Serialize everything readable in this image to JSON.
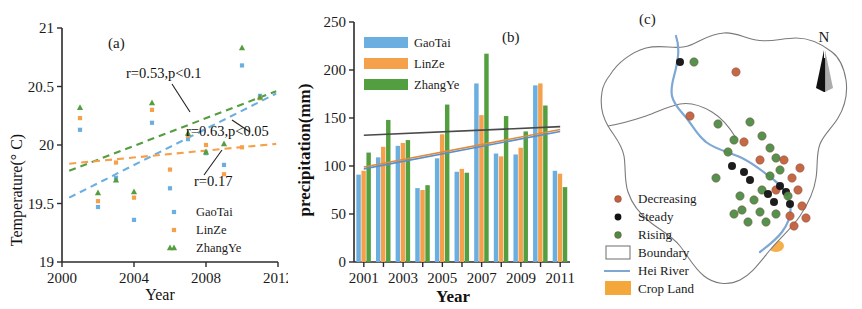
{
  "figure": {
    "panels": [
      "a",
      "b",
      "c"
    ]
  },
  "panel_a": {
    "tag": "(a)",
    "annotations": [
      {
        "text": "r=0.53,p<0.1"
      },
      {
        "text": "r=0.63,p<0.05"
      },
      {
        "text": "r=0.17"
      }
    ],
    "legend": [
      {
        "label": "GaoTai",
        "color": "#6BAEE0",
        "marker": "square"
      },
      {
        "label": "LinZe",
        "color": "#F5A04A",
        "marker": "square"
      },
      {
        "label": "ZhangYe",
        "color": "#539E3F",
        "marker": "triangle"
      }
    ]
  },
  "panel_b": {
    "tag": "(b)",
    "legend": [
      {
        "label": "GaoTai",
        "color": "#6BAEE0"
      },
      {
        "label": "LinZe",
        "color": "#F5A04A"
      },
      {
        "label": "ZhangYe",
        "color": "#539E3F"
      }
    ]
  },
  "panel_c": {
    "tag": "(c)",
    "north_label": "N",
    "legend": [
      {
        "label": "Decreasing",
        "color": "#C4603F",
        "type": "dot"
      },
      {
        "label": "Steady",
        "color": "#111111",
        "type": "dot"
      },
      {
        "label": "Rising",
        "color": "#4C8C46",
        "type": "dot"
      },
      {
        "label": "Boundary",
        "color": "#7a7a7a",
        "type": "box"
      },
      {
        "label": "Hei River",
        "color": "#7fa7d4",
        "type": "line"
      },
      {
        "label": "Crop Land",
        "color": "#F4A73B",
        "type": "swatch"
      }
    ]
  },
  "chart_data": [
    {
      "type": "scatter",
      "panel": "a",
      "title": "(a)",
      "xlabel": "Year",
      "ylabel": "Temperature(° C)",
      "xlim": [
        2000,
        2012
      ],
      "ylim": [
        19,
        21
      ],
      "xticks": [
        2000,
        2004,
        2008,
        2012
      ],
      "yticks": [
        19,
        19.5,
        20,
        20.5,
        21
      ],
      "grid": false,
      "legend_position": "bottom-right",
      "series": [
        {
          "name": "GaoTai",
          "color": "#6BAEE0",
          "marker": "square",
          "x": [
            2001,
            2002,
            2003,
            2004,
            2005,
            2006,
            2007,
            2008,
            2009,
            2010,
            2011
          ],
          "y": [
            20.13,
            19.47,
            19.72,
            19.36,
            20.19,
            19.63,
            20.05,
            19.93,
            19.83,
            20.68,
            20.42
          ]
        },
        {
          "name": "LinZe",
          "color": "#F5A04A",
          "marker": "square",
          "x": [
            2001,
            2002,
            2003,
            2004,
            2005,
            2006,
            2007,
            2008,
            2009,
            2010,
            2011
          ],
          "y": [
            20.23,
            19.52,
            19.85,
            19.55,
            20.3,
            19.79,
            20.08,
            20.0,
            19.75,
            19.98,
            20.4
          ]
        },
        {
          "name": "ZhangYe",
          "color": "#539E3F",
          "marker": "triangle",
          "x": [
            2001,
            2002,
            2003,
            2004,
            2005,
            2006,
            2007,
            2008,
            2009,
            2010,
            2011
          ],
          "y": [
            20.32,
            19.59,
            19.7,
            19.6,
            20.36,
            19.12,
            20.1,
            19.94,
            20.01,
            20.83,
            20.41
          ]
        }
      ],
      "trendlines": [
        {
          "name": "ZhangYe",
          "color": "#539E3F",
          "style": "dashed",
          "x": [
            2000.4,
            2011.9
          ],
          "y": [
            19.78,
            20.46
          ],
          "label": "r=0.53,p<0.1"
        },
        {
          "name": "GaoTai",
          "color": "#6BAEE0",
          "style": "dashed",
          "x": [
            2000.4,
            2011.9
          ],
          "y": [
            19.55,
            20.44
          ],
          "label": "r=0.63,p<0.05"
        },
        {
          "name": "LinZe",
          "color": "#F5A04A",
          "style": "dashed",
          "x": [
            2000.4,
            2011.9
          ],
          "y": [
            19.84,
            20.01
          ],
          "label": "r=0.17"
        }
      ]
    },
    {
      "type": "bar",
      "panel": "b",
      "title": "(b)",
      "xlabel": "Year",
      "ylabel": "precipitation(mm)",
      "ylim": [
        0,
        250
      ],
      "yticks": [
        0,
        50,
        100,
        150,
        200,
        250
      ],
      "xticks": [
        2001,
        2003,
        2005,
        2007,
        2009,
        2011
      ],
      "categories": [
        2001,
        2002,
        2003,
        2004,
        2005,
        2006,
        2007,
        2008,
        2009,
        2010,
        2011
      ],
      "grid": false,
      "legend_position": "top-left",
      "series": [
        {
          "name": "GaoTai",
          "color": "#6BAEE0",
          "values": [
            91,
            109,
            121,
            77,
            108,
            94,
            186,
            113,
            112,
            184,
            95
          ]
        },
        {
          "name": "LinZe",
          "color": "#F5A04A",
          "values": [
            95,
            120,
            124,
            75,
            133,
            97,
            153,
            110,
            119,
            186,
            92
          ]
        },
        {
          "name": "ZhangYe",
          "color": "#539E3F",
          "values": [
            114,
            148,
            127,
            80,
            164,
            93,
            217,
            152,
            136,
            163,
            78
          ]
        }
      ],
      "trendlines": [
        {
          "name": "trend-dark",
          "color": "#4a4a4a",
          "x": [
            2001,
            2011
          ],
          "y": [
            132,
            141
          ]
        },
        {
          "name": "trend-orange",
          "color": "#E08B3C",
          "x": [
            2001,
            2011
          ],
          "y": [
            99,
            138
          ]
        },
        {
          "name": "trend-blue",
          "color": "#5B8FC9",
          "x": [
            2001,
            2011
          ],
          "y": [
            97,
            136
          ]
        }
      ]
    },
    {
      "type": "map",
      "panel": "c",
      "title": "(c)",
      "legend_entries": [
        "Decreasing",
        "Steady",
        "Rising",
        "Boundary",
        "Hei River",
        "Crop Land"
      ],
      "marker_counts": {
        "Decreasing": 13,
        "Steady": 9,
        "Rising": 21
      }
    }
  ]
}
